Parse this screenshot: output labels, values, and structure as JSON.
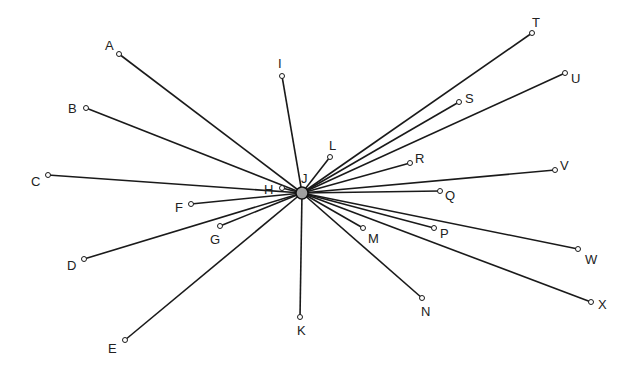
{
  "diagram": {
    "type": "star-network",
    "hub": {
      "label": "J",
      "x": 302,
      "y": 193,
      "r": 6,
      "label_x": 301,
      "label_y": 183
    },
    "nodes": [
      {
        "label": "A",
        "x": 119,
        "y": 54,
        "label_x": 105,
        "label_y": 50
      },
      {
        "label": "B",
        "x": 86,
        "y": 108,
        "label_x": 68,
        "label_y": 113
      },
      {
        "label": "C",
        "x": 48,
        "y": 175,
        "label_x": 31,
        "label_y": 186
      },
      {
        "label": "D",
        "x": 84,
        "y": 259,
        "label_x": 67,
        "label_y": 270
      },
      {
        "label": "E",
        "x": 125,
        "y": 340,
        "label_x": 108,
        "label_y": 353
      },
      {
        "label": "F",
        "x": 191,
        "y": 204,
        "label_x": 175,
        "label_y": 212
      },
      {
        "label": "G",
        "x": 220,
        "y": 226,
        "label_x": 210,
        "label_y": 244
      },
      {
        "label": "H",
        "x": 282,
        "y": 188,
        "label_x": 264,
        "label_y": 194
      },
      {
        "label": "I",
        "x": 282,
        "y": 76,
        "label_x": 278,
        "label_y": 68
      },
      {
        "label": "K",
        "x": 300,
        "y": 317,
        "label_x": 297,
        "label_y": 335
      },
      {
        "label": "L",
        "x": 330,
        "y": 157,
        "label_x": 329,
        "label_y": 150
      },
      {
        "label": "M",
        "x": 363,
        "y": 228,
        "label_x": 368,
        "label_y": 243
      },
      {
        "label": "N",
        "x": 422,
        "y": 298,
        "label_x": 421,
        "label_y": 316
      },
      {
        "label": "P",
        "x": 434,
        "y": 228,
        "label_x": 440,
        "label_y": 238
      },
      {
        "label": "Q",
        "x": 440,
        "y": 191,
        "label_x": 445,
        "label_y": 200
      },
      {
        "label": "R",
        "x": 410,
        "y": 163,
        "label_x": 415,
        "label_y": 163
      },
      {
        "label": "S",
        "x": 459,
        "y": 102,
        "label_x": 465,
        "label_y": 103
      },
      {
        "label": "T",
        "x": 532,
        "y": 33,
        "label_x": 532,
        "label_y": 27
      },
      {
        "label": "U",
        "x": 565,
        "y": 73,
        "label_x": 571,
        "label_y": 83
      },
      {
        "label": "V",
        "x": 555,
        "y": 170,
        "label_x": 560,
        "label_y": 170
      },
      {
        "label": "W",
        "x": 578,
        "y": 249,
        "label_x": 585,
        "label_y": 264
      },
      {
        "label": "X",
        "x": 591,
        "y": 302,
        "label_x": 598,
        "label_y": 309
      }
    ]
  }
}
